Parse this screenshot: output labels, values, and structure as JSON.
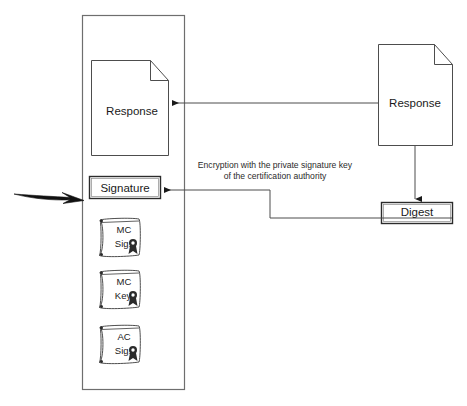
{
  "diagram": {
    "container": {
      "name": "terminal-boundary"
    },
    "left_document": {
      "label": "Response",
      "icon": "document-page-icon"
    },
    "signature_box": {
      "label": "Signature"
    },
    "right_document": {
      "label": "Response",
      "icon": "document-page-icon"
    },
    "digest_box": {
      "label": "Digest"
    },
    "annotation": {
      "line1": "Encryption with the private signature key",
      "line2": "of the certification authority"
    },
    "certificates": [
      {
        "line1": "MC",
        "line2": "Sig.",
        "icon": "certificate-scroll-icon"
      },
      {
        "line1": "MC",
        "line2": "Key",
        "icon": "certificate-scroll-icon"
      },
      {
        "line1": "AC",
        "line2": "Sig.",
        "icon": "certificate-scroll-icon"
      }
    ],
    "lightning": {
      "icon": "lightning-bolt-icon"
    },
    "colors": {
      "stroke": "#4d4d4d",
      "stroke_dark": "#1a1a1a",
      "text": "#1a1a1a",
      "background": "#ffffff"
    }
  }
}
